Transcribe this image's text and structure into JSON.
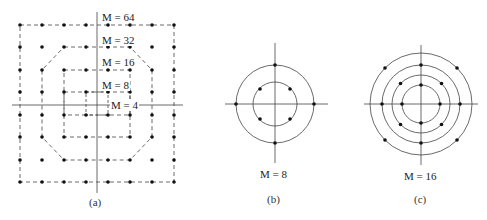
{
  "figure": {
    "panel_a": {
      "caption": "(a)",
      "labels": [
        "M = 64",
        "M = 32",
        "M = 16",
        "M = 8",
        "M = 4"
      ],
      "description": "Square/cross QAM constellations nested: 8x8 grid of points with dashed boundaries for M=64, 32, 16, 8, 4"
    },
    "panel_b": {
      "caption": "(b)",
      "label": "M = 8",
      "description": "Two concentric circles: inner circle with 4 points at 45/135/225/315 degrees, outer circle with 4 points on the axes"
    },
    "panel_c": {
      "caption": "(c)",
      "label": "M = 16",
      "description": "Four concentric circles with 4 points each, alternating axis and diagonal placement"
    }
  },
  "colors": {
    "line": "#333333",
    "dot": "#111111",
    "background": "#ffffff"
  }
}
